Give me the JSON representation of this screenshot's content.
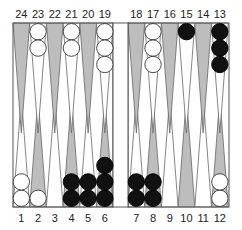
{
  "board": {
    "colors": {
      "background": "#ffffff",
      "frame": "#555555",
      "point_light": "#ffffff",
      "point_dark": "#bdbdbd",
      "checker_white": "#ffffff",
      "checker_black": "#111111"
    },
    "top_labels": [
      "24",
      "23",
      "22",
      "21",
      "20",
      "19",
      "18",
      "17",
      "16",
      "15",
      "14",
      "13"
    ],
    "bottom_labels": [
      "1",
      "2",
      "3",
      "4",
      "5",
      "6",
      "7",
      "8",
      "9",
      "10",
      "11",
      "12"
    ],
    "points": [
      {
        "number": 1,
        "color": "white",
        "count": 2
      },
      {
        "number": 2,
        "color": "white",
        "count": 1
      },
      {
        "number": 3,
        "color": null,
        "count": 0
      },
      {
        "number": 4,
        "color": "black",
        "count": 2
      },
      {
        "number": 5,
        "color": "black",
        "count": 2
      },
      {
        "number": 6,
        "color": "black",
        "count": 3
      },
      {
        "number": 7,
        "color": "black",
        "count": 2
      },
      {
        "number": 8,
        "color": "black",
        "count": 2
      },
      {
        "number": 9,
        "color": null,
        "count": 0
      },
      {
        "number": 10,
        "color": null,
        "count": 0
      },
      {
        "number": 11,
        "color": null,
        "count": 0
      },
      {
        "number": 12,
        "color": "white",
        "count": 2
      },
      {
        "number": 13,
        "color": "black",
        "count": 3
      },
      {
        "number": 14,
        "color": null,
        "count": 0
      },
      {
        "number": 15,
        "color": "black",
        "count": 1
      },
      {
        "number": 16,
        "color": null,
        "count": 0
      },
      {
        "number": 17,
        "color": "white",
        "count": 3
      },
      {
        "number": 18,
        "color": null,
        "count": 0
      },
      {
        "number": 19,
        "color": "white",
        "count": 3
      },
      {
        "number": 20,
        "color": null,
        "count": 0
      },
      {
        "number": 21,
        "color": "white",
        "count": 2
      },
      {
        "number": 22,
        "color": null,
        "count": 0
      },
      {
        "number": 23,
        "color": "white",
        "count": 2
      },
      {
        "number": 24,
        "color": null,
        "count": 0
      }
    ]
  }
}
